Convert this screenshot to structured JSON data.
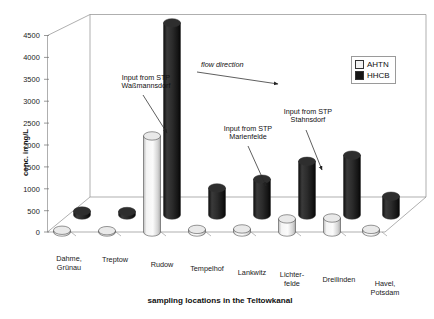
{
  "chart_data": {
    "type": "bar",
    "title": "",
    "subtitle": "",
    "xlabel": "sampling locations in the Teltowkanal",
    "ylabel": "conc. in ng/L",
    "ylim": [
      0,
      4500
    ],
    "yticks": [
      0,
      500,
      1000,
      1500,
      2000,
      2500,
      3000,
      3500,
      4000,
      4500
    ],
    "ytick_labels": [
      "0",
      "500",
      "1000",
      "1500",
      "2000",
      "2500",
      "3000",
      "3500",
      "4000",
      "4500"
    ],
    "grid": false,
    "projection": "3d-cylinder",
    "legend_position": "top-right",
    "categories": [
      "Dahme,\nGrünau",
      "Treptow",
      "Rudow",
      "Tempelhof",
      "Lankwitz",
      "Lichter-\nfelde",
      "Dreilinden",
      "Havel,\nPotsdam"
    ],
    "series": [
      {
        "name": "AHTN",
        "color": "#f0f0f0",
        "values": [
          40,
          30,
          2200,
          60,
          70,
          300,
          320,
          60
        ]
      },
      {
        "name": "HHCB",
        "color": "#161616",
        "values": [
          90,
          80,
          4400,
          620,
          820,
          1230,
          1370,
          430
        ]
      }
    ],
    "annotations": [
      {
        "id": "flow",
        "text": "flow direction",
        "style": "italic-arrow"
      },
      {
        "id": "stp-1",
        "text": "Input from STP\nWaßmannsdorf"
      },
      {
        "id": "stp-2",
        "text": "Input from STP\nMarienfelde"
      },
      {
        "id": "stp-3",
        "text": "Input from STP\nStahnsdorf"
      }
    ]
  },
  "legend": {
    "items": [
      {
        "label": "AHTN",
        "color": "#f0f0f0"
      },
      {
        "label": "HHCB",
        "color": "#161616"
      }
    ]
  }
}
